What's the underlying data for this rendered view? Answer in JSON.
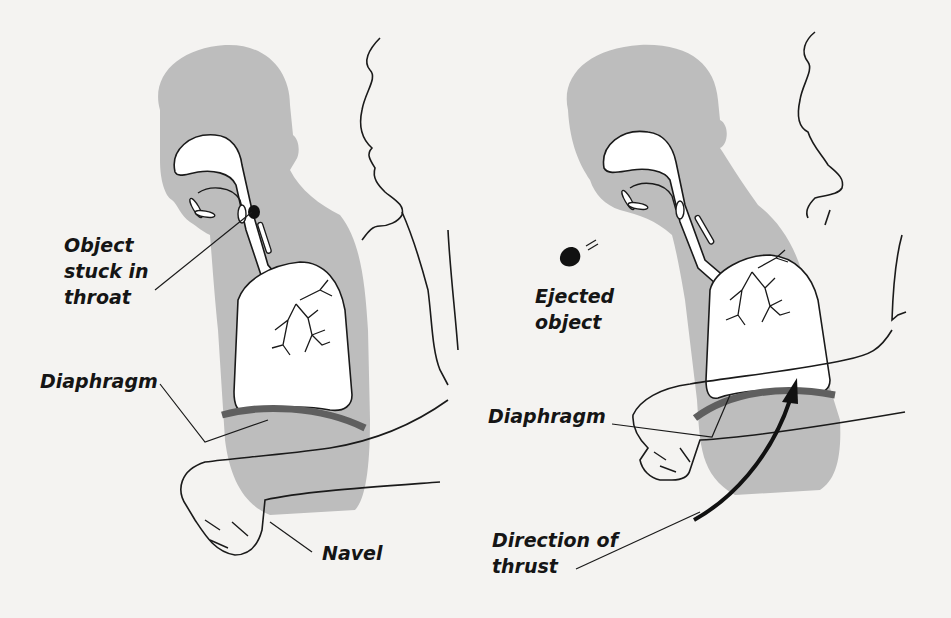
{
  "diagram": {
    "panels": [
      {
        "id": "before",
        "labels": {
          "object": [
            "Object",
            "stuck in",
            "throat"
          ],
          "diaphragm": "Diaphragm",
          "navel": "Navel"
        }
      },
      {
        "id": "after",
        "labels": {
          "object": [
            "Ejected",
            "object"
          ],
          "diaphragm": "Diaphragm",
          "thrust": [
            "Direction of",
            "thrust"
          ]
        }
      }
    ],
    "colors": {
      "background": "#f4f3f1",
      "body_silhouette": "#bdbdbd",
      "diaphragm": "#5f5f5f",
      "line": "#1a1a1a",
      "airway_fill": "#ffffff"
    }
  }
}
